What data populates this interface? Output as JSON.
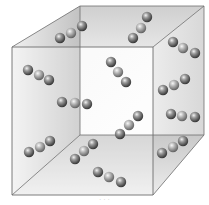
{
  "diagram": {
    "colors": {
      "edge": "#6e6e6e",
      "back_face": "#e4e4e4",
      "top_face": "#d9d9d9",
      "left_face": "#c9c9c9",
      "right_face": "#dedede",
      "bottom_face": "#d3d3d3",
      "front_face": "#f4f4f4",
      "atom_dark": "#3c3c3c",
      "atom_mid": "#8a8a8a",
      "atom_light": "#f2f2f2"
    },
    "cube": {
      "front": {
        "tl": [
          12,
          47
        ],
        "tr": [
          153,
          47
        ],
        "br": [
          153,
          195
        ],
        "bl": [
          12,
          195
        ]
      },
      "back": {
        "tl": [
          80,
          6
        ],
        "tr": [
          204,
          6
        ],
        "br": [
          204,
          135
        ],
        "bl": [
          80,
          135
        ]
      }
    },
    "atom_radius": 5.2,
    "molecules": [
      {
        "id": "m1",
        "atoms": [
          [
            60,
            38
          ],
          [
            71,
            33
          ],
          [
            82,
            26
          ]
        ]
      },
      {
        "id": "m2",
        "atoms": [
          [
            133,
            38
          ],
          [
            141,
            28
          ],
          [
            147,
            17
          ]
        ]
      },
      {
        "id": "m3",
        "atoms": [
          [
            173,
            42
          ],
          [
            183,
            48
          ],
          [
            195,
            53
          ]
        ]
      },
      {
        "id": "m4",
        "atoms": [
          [
            28,
            70
          ],
          [
            39,
            75
          ],
          [
            49,
            80
          ]
        ]
      },
      {
        "id": "m5",
        "atoms": [
          [
            111,
            62
          ],
          [
            118,
            72
          ],
          [
            126,
            82
          ]
        ]
      },
      {
        "id": "m6",
        "atoms": [
          [
            163,
            90
          ],
          [
            174,
            85
          ],
          [
            185,
            79
          ]
        ]
      },
      {
        "id": "m7",
        "atoms": [
          [
            62,
            102
          ],
          [
            75,
            103
          ],
          [
            87,
            104
          ]
        ]
      },
      {
        "id": "m8",
        "atoms": [
          [
            171,
            114
          ],
          [
            182,
            116
          ],
          [
            195,
            117
          ]
        ]
      },
      {
        "id": "m9",
        "atoms": [
          [
            120,
            134
          ],
          [
            129,
            125
          ],
          [
            138,
            116
          ]
        ]
      },
      {
        "id": "m10",
        "atoms": [
          [
            29,
            152
          ],
          [
            40,
            147
          ],
          [
            50,
            141
          ]
        ]
      },
      {
        "id": "m11",
        "atoms": [
          [
            75,
            159
          ],
          [
            84,
            151
          ],
          [
            93,
            144
          ]
        ]
      },
      {
        "id": "m12",
        "atoms": [
          [
            162,
            153
          ],
          [
            173,
            147
          ],
          [
            183,
            141
          ]
        ]
      },
      {
        "id": "m13",
        "atoms": [
          [
            98,
            172
          ],
          [
            109,
            177
          ],
          [
            121,
            182
          ]
        ]
      }
    ],
    "caption": "· · ·"
  }
}
